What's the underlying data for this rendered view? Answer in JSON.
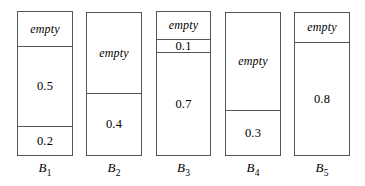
{
  "figure": {
    "background_color": "#ffffff",
    "line_color": "#555555",
    "text_color": "#000000",
    "empty_label": "empty"
  },
  "chart_data": {
    "type": "bar",
    "title": "",
    "subtitle": "",
    "xlabel": "",
    "ylabel": "",
    "ylim": [
      0,
      1
    ],
    "grid": false,
    "legend": null,
    "note": "Bin packing illustration: five unit-capacity bins, each stacked with item sizes from bottom up; remaining headroom marked 'empty'.",
    "categories": [
      "B1",
      "B2",
      "B3",
      "B4",
      "B5"
    ],
    "capacity": 1.0,
    "series": [
      {
        "name": "B1",
        "label": "B",
        "subscript": "1",
        "items_bottom_up": [
          0.2,
          0.5
        ],
        "empty": 0.3,
        "segments_top_down": [
          {
            "kind": "empty",
            "label": "empty",
            "value": 0.3
          },
          {
            "kind": "item",
            "label": "0.5",
            "value": 0.5
          },
          {
            "kind": "item",
            "label": "0.2",
            "value": 0.2
          }
        ]
      },
      {
        "name": "B2",
        "label": "B",
        "subscript": "2",
        "items_bottom_up": [
          0.4
        ],
        "empty": 0.6,
        "segments_top_down": [
          {
            "kind": "empty",
            "label": "empty",
            "value": 0.6
          },
          {
            "kind": "item",
            "label": "0.4",
            "value": 0.4
          }
        ]
      },
      {
        "name": "B3",
        "label": "B",
        "subscript": "3",
        "items_bottom_up": [
          0.7,
          0.1
        ],
        "empty": 0.2,
        "segments_top_down": [
          {
            "kind": "empty",
            "label": "empty",
            "value": 0.2
          },
          {
            "kind": "item",
            "label": "0.1",
            "value": 0.1
          },
          {
            "kind": "item",
            "label": "0.7",
            "value": 0.7
          }
        ]
      },
      {
        "name": "B4",
        "label": "B",
        "subscript": "4",
        "items_bottom_up": [
          0.3
        ],
        "empty": 0.7,
        "segments_top_down": [
          {
            "kind": "empty",
            "label": "empty",
            "value": 0.7
          },
          {
            "kind": "item",
            "label": "0.3",
            "value": 0.3
          }
        ]
      },
      {
        "name": "B5",
        "label": "B",
        "subscript": "5",
        "items_bottom_up": [
          0.8
        ],
        "empty": 0.2,
        "segments_top_down": [
          {
            "kind": "empty",
            "label": "empty",
            "value": 0.2
          },
          {
            "kind": "item",
            "label": "0.8",
            "value": 0.8
          }
        ]
      }
    ]
  },
  "layout": {
    "bins": [
      {
        "x": 17,
        "width": 56,
        "top": 11,
        "height": 145,
        "caption_top": 161
      },
      {
        "x": 86,
        "width": 56,
        "top": 12,
        "height": 144,
        "caption_top": 161
      },
      {
        "x": 156,
        "width": 55,
        "top": 11,
        "height": 145,
        "caption_top": 161
      },
      {
        "x": 225,
        "width": 56,
        "top": 12,
        "height": 144,
        "caption_top": 161
      },
      {
        "x": 294,
        "width": 56,
        "top": 12,
        "height": 144,
        "caption_top": 161
      }
    ],
    "segment_fractions": [
      [
        0.235,
        0.56,
        0.205
      ],
      [
        0.562,
        0.438
      ],
      [
        0.186,
        0.097,
        0.717
      ],
      [
        0.681,
        0.319
      ],
      [
        0.201,
        0.799
      ]
    ]
  }
}
